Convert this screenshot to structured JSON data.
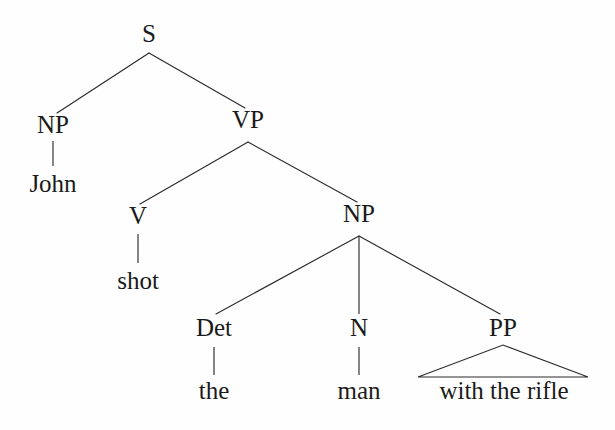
{
  "figure": {
    "kind": "constituency-syntax-tree",
    "sentence": "John shot the man with the rifle",
    "background_color": "#fefefe",
    "line_color": "#2b2b2b",
    "text_color": "#1a1a1a"
  },
  "nodes": {
    "s": {
      "label": "S",
      "x": 149,
      "y": 42
    },
    "np_subject": {
      "label": "NP",
      "x": 53,
      "y": 133
    },
    "vp": {
      "label": "VP",
      "x": 248,
      "y": 128
    },
    "john": {
      "label": "John",
      "x": 53,
      "y": 192
    },
    "v": {
      "label": "V",
      "x": 138,
      "y": 224
    },
    "np_object": {
      "label": "NP",
      "x": 359,
      "y": 222
    },
    "shot": {
      "label": "shot",
      "x": 138,
      "y": 289
    },
    "det": {
      "label": "Det",
      "x": 214,
      "y": 336
    },
    "n": {
      "label": "N",
      "x": 359,
      "y": 336
    },
    "pp": {
      "label": "PP",
      "x": 503,
      "y": 336
    },
    "the": {
      "label": "the",
      "x": 214,
      "y": 399
    },
    "man": {
      "label": "man",
      "x": 359,
      "y": 399
    },
    "with_the_rifle": {
      "label": "with the rifle",
      "x": 504,
      "y": 399
    }
  },
  "edges": [
    {
      "name": "s-to-np-subject",
      "from": "s",
      "to": "np_subject",
      "x1": 149,
      "y1": 53,
      "x2": 57,
      "y2": 113,
      "type": "diagonal"
    },
    {
      "name": "s-to-vp",
      "from": "s",
      "to": "vp",
      "x1": 149,
      "y1": 53,
      "x2": 245,
      "y2": 108,
      "type": "diagonal"
    },
    {
      "name": "np-subject-to-john",
      "from": "np_subject",
      "to": "john",
      "x1": 53,
      "y1": 141,
      "x2": 53,
      "y2": 166,
      "type": "vertical"
    },
    {
      "name": "vp-to-v",
      "from": "vp",
      "to": "v",
      "x1": 248,
      "y1": 142,
      "x2": 140,
      "y2": 204,
      "type": "diagonal"
    },
    {
      "name": "vp-to-np-object",
      "from": "vp",
      "to": "np_object",
      "x1": 248,
      "y1": 142,
      "x2": 357,
      "y2": 202,
      "type": "diagonal"
    },
    {
      "name": "v-to-shot",
      "from": "v",
      "to": "shot",
      "x1": 138,
      "y1": 234,
      "x2": 138,
      "y2": 263,
      "type": "vertical"
    },
    {
      "name": "np-object-to-det",
      "from": "np_object",
      "to": "det",
      "x1": 359,
      "y1": 236,
      "x2": 216,
      "y2": 314,
      "type": "diagonal"
    },
    {
      "name": "np-object-to-n",
      "from": "np_object",
      "to": "n",
      "x1": 359,
      "y1": 236,
      "x2": 359,
      "y2": 314,
      "type": "vertical"
    },
    {
      "name": "np-object-to-pp",
      "from": "np_object",
      "to": "pp",
      "x1": 359,
      "y1": 236,
      "x2": 500,
      "y2": 314,
      "type": "diagonal"
    },
    {
      "name": "det-to-the",
      "from": "det",
      "to": "the",
      "x1": 214,
      "y1": 347,
      "x2": 214,
      "y2": 375,
      "type": "vertical"
    },
    {
      "name": "n-to-man",
      "from": "n",
      "to": "man",
      "x1": 359,
      "y1": 347,
      "x2": 359,
      "y2": 375,
      "type": "vertical"
    }
  ],
  "triangle": {
    "name": "pp-triangle",
    "parent": "pp",
    "apex_x": 503,
    "apex_y": 345,
    "left_x": 418,
    "left_y": 377,
    "right_x": 588,
    "right_y": 377
  }
}
